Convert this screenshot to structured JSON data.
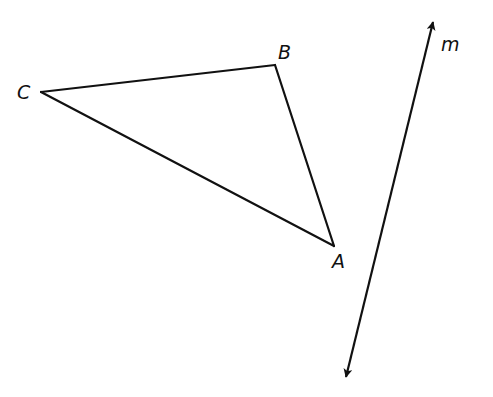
{
  "diagram": {
    "type": "geometry",
    "stroke_color": "#111111",
    "background": "#ffffff",
    "triangle": {
      "vertices": {
        "A": {
          "x": 334,
          "y": 246,
          "label": "A",
          "label_x": 332,
          "label_y": 268
        },
        "B": {
          "x": 275,
          "y": 65,
          "label": "B",
          "label_x": 278,
          "label_y": 59
        },
        "C": {
          "x": 41,
          "y": 92,
          "label": "C",
          "label_x": 17,
          "label_y": 99
        }
      }
    },
    "line_m": {
      "label": "m",
      "label_x": 441,
      "label_y": 51,
      "start": {
        "x": 433,
        "y": 22
      },
      "end": {
        "x": 346,
        "y": 377
      },
      "arrows": "both"
    }
  }
}
